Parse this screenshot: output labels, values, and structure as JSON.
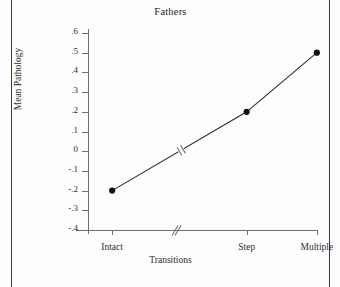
{
  "figure": {
    "title": "Fathers"
  },
  "chart_data": {
    "type": "line",
    "title": "Fathers",
    "xlabel": "Transitions",
    "ylabel": "Mean Pathology",
    "categories": [
      "Intact",
      "Step",
      "Multiple"
    ],
    "values": [
      -0.2,
      0.2,
      0.5
    ],
    "series": [
      {
        "name": "Fathers",
        "values": [
          -0.2,
          0.2,
          0.5
        ]
      }
    ],
    "ylim": [
      -0.4,
      0.6
    ],
    "yticks": [
      0.6,
      0.5,
      0.4,
      0.3,
      0.2,
      0.1,
      0,
      -0.1,
      -0.2,
      -0.3,
      -0.4
    ],
    "ytick_labels": [
      ".6",
      ".5",
      ".4",
      ".3",
      ".2",
      ".1",
      "0",
      "-.1",
      "-.2",
      "-.3",
      "-.4"
    ],
    "xtick_positions": [
      0.105,
      0.69,
      0.995
    ],
    "grid": false,
    "legend": false,
    "markers": "filled-circle",
    "axis_break_x": 0.405,
    "line_break": true,
    "colors": {
      "line": "#2b2b2b",
      "marker": "#111111",
      "axis": "#6f6f6f",
      "text": "#2e2e2e",
      "background": "#fdfdfd"
    }
  }
}
